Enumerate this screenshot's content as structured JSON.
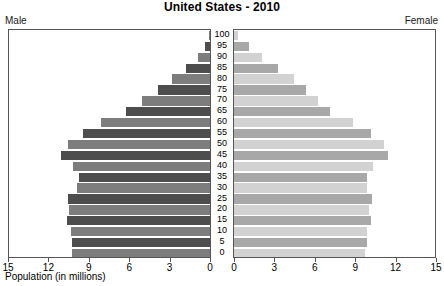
{
  "chart_data": {
    "type": "bar",
    "title": "United States - 2010",
    "subtitle": "",
    "xlabel": "Population (in millions)",
    "ylabel": "",
    "orientation": "horizontal",
    "layout": "population-pyramid",
    "grid": false,
    "legend_position": "top-corners",
    "left_label": "Male",
    "right_label": "Female",
    "xlim": [
      0,
      15
    ],
    "left_axis_ticks": [
      "15",
      "12",
      "9",
      "6",
      "3",
      "0"
    ],
    "right_axis_ticks": [
      "0",
      "3",
      "6",
      "9",
      "12",
      "15"
    ],
    "tick_values": [
      15,
      12,
      9,
      6,
      3,
      0
    ],
    "categories": [
      "100",
      "95",
      "90",
      "85",
      "80",
      "75",
      "70",
      "65",
      "60",
      "55",
      "50",
      "45",
      "40",
      "35",
      "30",
      "25",
      "20",
      "15",
      "10",
      "5",
      "0"
    ],
    "series": [
      {
        "name": "Male",
        "side": "left",
        "color": "#4d4d4d",
        "alt_color": "#7d7d7d",
        "values": [
          0.05,
          0.4,
          0.9,
          1.8,
          2.8,
          3.9,
          5.1,
          6.3,
          8.1,
          9.5,
          10.6,
          11.1,
          10.2,
          9.8,
          9.9,
          10.6,
          10.5,
          10.7,
          10.4,
          10.3,
          10.3
        ]
      },
      {
        "name": "Female",
        "side": "right",
        "color": "#a8a8a8",
        "alt_color": "#d2d2d2",
        "values": [
          0.3,
          1.1,
          2.1,
          3.3,
          4.5,
          5.4,
          6.3,
          7.2,
          8.9,
          10.2,
          11.2,
          11.5,
          10.4,
          9.9,
          9.9,
          10.3,
          10.1,
          10.2,
          9.9,
          9.9,
          9.8
        ]
      }
    ]
  }
}
